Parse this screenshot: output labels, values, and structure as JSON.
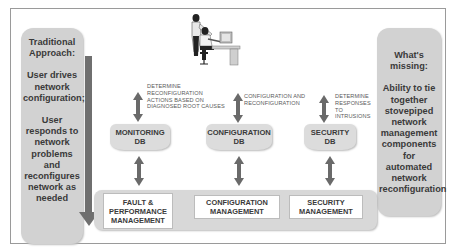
{
  "left_panel": {
    "heading": "Traditional Approach:",
    "para1": "User drives network configuration;",
    "para2": "User responds to network problems and reconfigures network as needed"
  },
  "right_panel": {
    "heading": "What's missing:",
    "body": "Ability to tie together stovepiped network management components for automated network reconfiguration"
  },
  "illustration": {
    "icon": "user-at-workstation-icon"
  },
  "databases": [
    {
      "label_line1": "MONITORING",
      "label_line2": "DB",
      "note": "DETERMINE RECONFIGURATION ACTIONS BASED ON DIAGNOSED ROOT CAUSES"
    },
    {
      "label_line1": "CONFIGURATION",
      "label_line2": "DB",
      "note": "CONFIGURATION AND RECONFIGURATION"
    },
    {
      "label_line1": "SECURITY",
      "label_line2": "DB",
      "note": "DETERMINE RESPONSES TO INTRUSIONS"
    }
  ],
  "management": [
    {
      "label": "FAULT & PERFORMANCE MANAGEMENT"
    },
    {
      "label": "CONFIGURATION MANAGEMENT"
    },
    {
      "label": "SECURITY MANAGEMENT"
    }
  ],
  "colors": {
    "panel": "#d2d2d2",
    "arrow": "#6a6a6a",
    "text": "#3a3a3a"
  }
}
